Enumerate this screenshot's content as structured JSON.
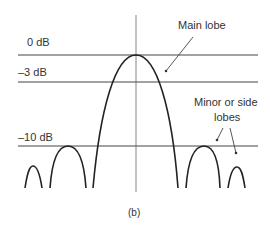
{
  "diagram": {
    "caption": "(b)",
    "levels": [
      {
        "label": "0 dB",
        "value_db": 0
      },
      {
        "label": "–3 dB",
        "value_db": -3
      },
      {
        "label": "–10 dB",
        "value_db": -10
      }
    ],
    "annotations": {
      "main_lobe": "Main lobe",
      "side_lobes_line1": "Minor or side",
      "side_lobes_line2": "lobes"
    },
    "colors": {
      "line": "#333333",
      "axis": "#888888",
      "text": "#333333"
    }
  }
}
